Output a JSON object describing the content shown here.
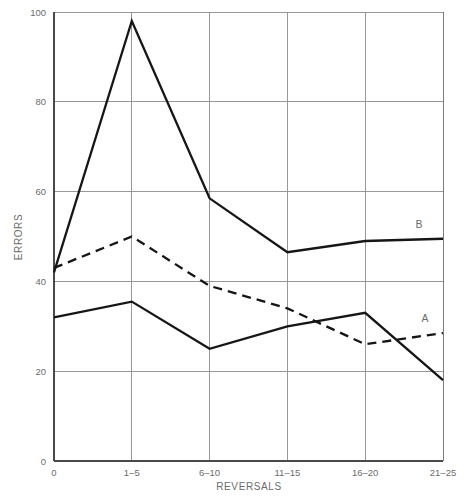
{
  "chart_data": {
    "type": "line",
    "title": "",
    "xlabel": "REVERSALS",
    "ylabel": "ERRORS",
    "categories": [
      "0",
      "1–5",
      "6–10",
      "11–15",
      "16–20",
      "21–25"
    ],
    "ylim": [
      0,
      100
    ],
    "yticks": [
      0,
      20,
      40,
      60,
      80,
      100
    ],
    "ytick_labels": [
      "0",
      "20",
      "40",
      "60",
      "80",
      "100"
    ],
    "grid": "both",
    "legend_position": "inline-right-end-labels",
    "series": [
      {
        "name": "B",
        "style": "solid",
        "label": "B",
        "color": "#161616",
        "values": [
          42,
          98,
          58.5,
          46.5,
          49,
          49.5
        ]
      },
      {
        "name": "A-dashed",
        "style": "dashed",
        "label": "A",
        "color": "#161616",
        "values": [
          43,
          50,
          39,
          34,
          26,
          28.5
        ]
      },
      {
        "name": "A-solid",
        "style": "solid",
        "label": "",
        "color": "#161616",
        "values": [
          32,
          35.5,
          25,
          30,
          33,
          18
        ]
      }
    ],
    "annotations": [
      {
        "text": "B",
        "x_category": "21–25",
        "y": 52.5
      },
      {
        "text": "A",
        "x_category": "21–25",
        "y": 31.5
      }
    ]
  },
  "axes": {
    "y_title": "ERRORS",
    "x_title": "REVERSALS",
    "y_ticks": [
      "100",
      "80",
      "60",
      "40",
      "20",
      "0"
    ],
    "x_ticks": [
      "0",
      "1–5",
      "6–10",
      "11–15",
      "16–20",
      "21–25"
    ]
  },
  "labels": {
    "series_b": "B",
    "series_a": "A"
  }
}
